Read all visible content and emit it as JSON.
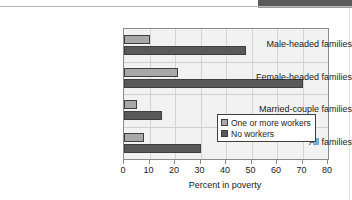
{
  "chart_data": {
    "type": "bar",
    "orientation": "horizontal",
    "title": "",
    "xlabel": "Percent in poverty",
    "ylabel": "",
    "xlim": [
      0,
      80
    ],
    "xticks": [
      0,
      10,
      20,
      30,
      40,
      50,
      60,
      70,
      80
    ],
    "xtick_labels": [
      "0",
      "10",
      "20",
      "30",
      "40",
      "50",
      "60",
      "70",
      "80"
    ],
    "grid": "vertical",
    "legend_position": "inside lower-right",
    "categories": [
      "Male-headed families",
      "Female-headed families",
      "Married-couple families",
      "All families"
    ],
    "series": [
      {
        "name": "One or more workers",
        "color": "#a8a8a8",
        "values": [
          10,
          21,
          5,
          8
        ]
      },
      {
        "name": "No workers",
        "color": "#595959",
        "values": [
          48,
          70,
          15,
          30
        ]
      }
    ]
  },
  "legend": {
    "items": [
      {
        "label": "One or more workers",
        "swatch": "light"
      },
      {
        "label": "No workers",
        "swatch": "dark"
      }
    ]
  },
  "colors": {
    "plot_background": "#f2f2f2",
    "axis": "#8c8c8c",
    "gridline": "#d4d4d4",
    "bar_light": "#a8a8a8",
    "bar_dark": "#595959",
    "text": "#1b1b1b",
    "scan_band": "#5b5b5b"
  }
}
